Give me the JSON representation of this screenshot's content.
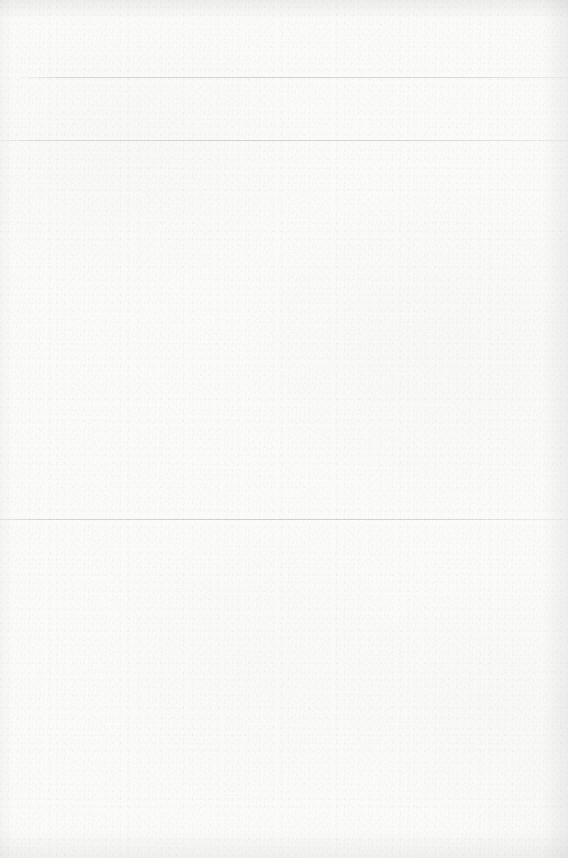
{
  "document": {
    "kind": "blank-scanned-page",
    "width": 568,
    "height": 858,
    "text_content": "",
    "paper_color": "#fbfbfa",
    "rule_color": "#96989c"
  },
  "rules": [
    {
      "id": "rule-1",
      "top": 77,
      "label": ""
    },
    {
      "id": "rule-2",
      "top": 140,
      "label": ""
    },
    {
      "id": "rule-3",
      "top": 519,
      "label": ""
    }
  ],
  "edges": {
    "top": "",
    "bottom": "",
    "left": "",
    "right": ""
  }
}
